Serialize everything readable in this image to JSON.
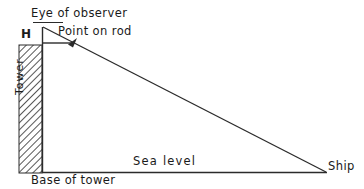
{
  "diagram": {
    "stroke_color": "#2b2b2b",
    "background_color": "#ffffff",
    "labels": {
      "eye_of_observer": "Eye of observer",
      "point_on_rod": "Point on rod",
      "height_marker": "H",
      "tower": "Tower",
      "sea_level": "Sea  level",
      "base_of_tower": "Base of tower",
      "ship": "Ship"
    },
    "elements": {
      "tower_body": "hatched-rectangle",
      "sight_line": "line-from-eye-to-ship",
      "rod_line": "horizontal-line-with-arrow",
      "sea_level_line": "horizontal-baseline",
      "tower_vertical_line": "vertical-line"
    }
  }
}
